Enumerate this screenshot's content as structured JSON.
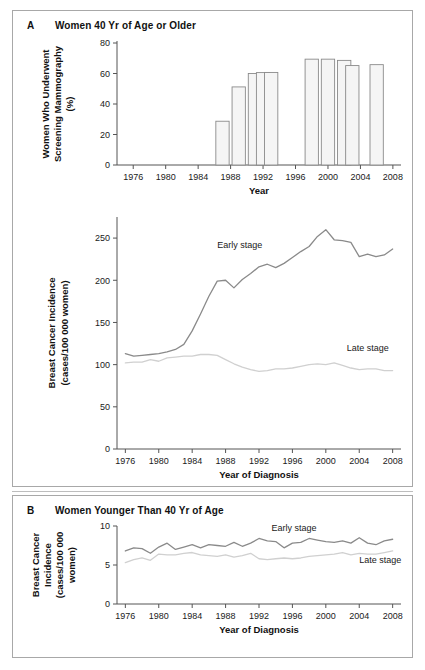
{
  "figure": {
    "panels": [
      {
        "letter": "A",
        "title": "Women 40 Yr of Age or Older"
      },
      {
        "letter": "B",
        "title": "Women Younger Than 40 Yr of Age"
      }
    ]
  },
  "colors": {
    "early_stage_line": "#8a8a8a",
    "late_stage_line": "#d0d0d0",
    "bar_fill": "#f5f5f5",
    "bar_stroke": "#8a8a8a",
    "axis": "#555555",
    "panel_border": "#a8a8a8",
    "text": "#111111"
  },
  "chart_data": [
    {
      "type": "bar",
      "id": "panelA-mammography",
      "title": "Women 40 Yr of Age or Older",
      "panel_letter": "A",
      "xlabel": "Year",
      "ylabel": "Women Who Underwent Screening Mammography (%)",
      "ylabel_line1": "Women Who Underwent",
      "ylabel_line2": "Screening Mammography",
      "ylabel_line3": "(%)",
      "ylim": [
        0,
        80
      ],
      "yticks": [
        0,
        20,
        40,
        60,
        80
      ],
      "xlim": [
        1974,
        2009
      ],
      "xticks": [
        1976,
        1980,
        1984,
        1988,
        1992,
        1996,
        2000,
        2004,
        2008
      ],
      "grid": false,
      "legend": "none",
      "categories": [
        1987,
        1989,
        1991,
        1992,
        1993,
        1998,
        2000,
        2002,
        2003,
        2006
      ],
      "values": [
        28.7,
        51.2,
        60.0,
        60.6,
        60.7,
        69.4,
        69.4,
        68.6,
        65.2,
        65.8
      ]
    },
    {
      "type": "line",
      "id": "panelA-incidence",
      "panel_letter": "A",
      "xlabel": "Year of Diagnosis",
      "ylabel": "Breast Cancer Incidence (cases/100 000 women)",
      "ylabel_line1": "Breast Cancer Incidence",
      "ylabel_line2": "(cases/100 000 women)",
      "ylim": [
        0,
        275
      ],
      "yticks": [
        0,
        50,
        100,
        150,
        200,
        250
      ],
      "xlim": [
        1975,
        2009
      ],
      "xticks": [
        1976,
        1980,
        1984,
        1988,
        1992,
        1996,
        2000,
        2004,
        2008
      ],
      "grid": false,
      "legend": "inline-annotations",
      "annotations": [
        {
          "text": "Early stage",
          "x": 1987.0,
          "y": 238
        },
        {
          "text": "Late stage",
          "x": 2002.5,
          "y": 116
        }
      ],
      "x": [
        1976,
        1977,
        1978,
        1979,
        1980,
        1981,
        1982,
        1983,
        1984,
        1985,
        1986,
        1987,
        1988,
        1989,
        1990,
        1991,
        1992,
        1993,
        1994,
        1995,
        1996,
        1997,
        1998,
        1999,
        2000,
        2001,
        2002,
        2003,
        2004,
        2005,
        2006,
        2007,
        2008
      ],
      "series": [
        {
          "name": "Early stage",
          "values": [
            113,
            110,
            111,
            112,
            113,
            115,
            118,
            124,
            140,
            160,
            181,
            199,
            200,
            191,
            201,
            208,
            216,
            219,
            215,
            220,
            227,
            234,
            240,
            252,
            260,
            248,
            247,
            245,
            228,
            231,
            228,
            230,
            237
          ]
        },
        {
          "name": "Late stage",
          "values": [
            102,
            103,
            103,
            106,
            104,
            108,
            109,
            110,
            110,
            112,
            112,
            111,
            106,
            101,
            97,
            94,
            92,
            93,
            95,
            95,
            96,
            98,
            100,
            101,
            100,
            102,
            99,
            96,
            94,
            95,
            95,
            93,
            93
          ]
        }
      ]
    },
    {
      "type": "line",
      "id": "panelB-incidence",
      "title": "Women Younger Than 40 Yr of Age",
      "panel_letter": "B",
      "xlabel": "Year of Diagnosis",
      "ylabel": "Breast Cancer Incidence (cases/100 000 women)",
      "ylabel_line1": "Breast Cancer",
      "ylabel_line2": "Incidence",
      "ylabel_line3": "(cases/100 000",
      "ylabel_line4": "women)",
      "ylim": [
        0,
        10
      ],
      "yticks": [
        0,
        5,
        10
      ],
      "xlim": [
        1975,
        2009
      ],
      "xticks": [
        1976,
        1980,
        1984,
        1988,
        1992,
        1996,
        2000,
        2004,
        2008
      ],
      "grid": false,
      "legend": "inline-annotations",
      "annotations": [
        {
          "text": "Early stage",
          "x": 1993.5,
          "y": 9.3
        },
        {
          "text": "Late stage",
          "x": 2004.0,
          "y": 5.3
        }
      ],
      "x": [
        1976,
        1977,
        1978,
        1979,
        1980,
        1981,
        1982,
        1983,
        1984,
        1985,
        1986,
        1987,
        1988,
        1989,
        1990,
        1991,
        1992,
        1993,
        1994,
        1995,
        1996,
        1997,
        1998,
        1999,
        2000,
        2001,
        2002,
        2003,
        2004,
        2005,
        2006,
        2007,
        2008
      ],
      "series": [
        {
          "name": "Early stage",
          "values": [
            6.8,
            7.2,
            7.1,
            6.5,
            7.3,
            7.8,
            7.0,
            7.3,
            7.6,
            7.2,
            7.6,
            7.5,
            7.4,
            7.9,
            7.4,
            7.8,
            8.4,
            8.1,
            8.0,
            7.2,
            7.8,
            7.9,
            8.4,
            8.2,
            8.0,
            7.9,
            8.1,
            7.8,
            8.5,
            7.8,
            7.6,
            8.1,
            8.3
          ]
        },
        {
          "name": "Late stage",
          "values": [
            5.3,
            5.7,
            5.9,
            5.6,
            6.4,
            6.3,
            6.3,
            6.5,
            6.6,
            6.3,
            6.2,
            6.1,
            6.3,
            6.0,
            6.2,
            6.5,
            5.8,
            5.7,
            5.8,
            5.9,
            5.8,
            5.9,
            6.1,
            6.2,
            6.3,
            6.4,
            6.6,
            6.3,
            6.5,
            6.4,
            6.4,
            6.6,
            6.8
          ]
        }
      ]
    }
  ]
}
